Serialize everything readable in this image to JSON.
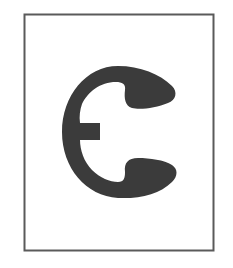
{
  "image": {
    "subject": "E-clip retaining ring silhouette",
    "alt": "E-clip (external retaining ring) product illustration in a bordered frame"
  },
  "colors": {
    "background": "#ffffff",
    "frame_stroke": "#5a5a5a",
    "part_fill": "#3b3b3b"
  }
}
